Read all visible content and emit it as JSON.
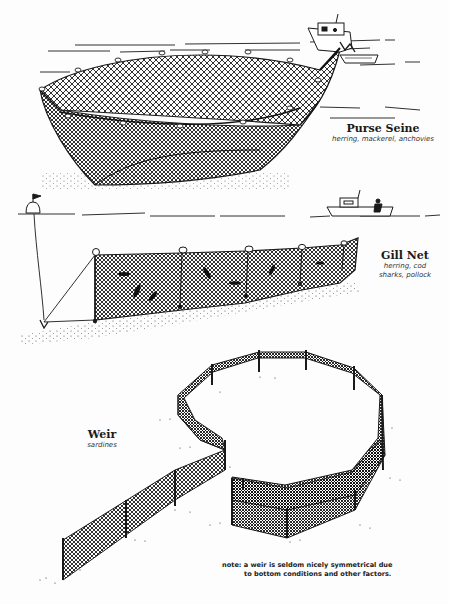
{
  "diagram": {
    "type": "illustration",
    "colors": {
      "ink": "#1a1a1a",
      "background": "#fdfdfd"
    },
    "sections": [
      {
        "id": "purse-seine",
        "title": "Purse Seine",
        "species": "herring, mackerel, anchovies"
      },
      {
        "id": "gill-net",
        "title": "Gill Net",
        "species_line1": "herring, cod",
        "species_line2": "sharks, pollock"
      },
      {
        "id": "weir",
        "title": "Weir",
        "species": "sardines"
      }
    ],
    "note": {
      "line1": "note: a weir is seldom nicely symmetrical due",
      "line2": "to bottom conditions and other factors."
    }
  }
}
